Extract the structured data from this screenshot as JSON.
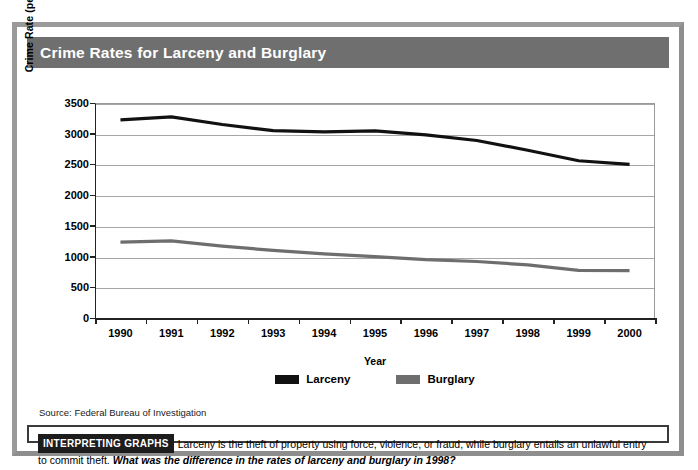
{
  "figure": {
    "title": "Crime Rates for Larceny and Burglary",
    "source": "Source: Federal Bureau of Investigation"
  },
  "caption": {
    "badge": "INTERPRETING GRAPHS",
    "body": "Larceny is the theft of property using force, violence, or fraud, while burglary entails an unlawful entry to commit theft.",
    "question": "What was the difference in the rates of larceny and burglary in 1998?"
  },
  "colors": {
    "larceny": "#111111",
    "burglary": "#6e6e6e",
    "title_band": "#6f6f6f",
    "frame": "#9a9a9a",
    "gridline": "#a6a6a6",
    "axis": "#222222"
  },
  "chart_data": {
    "type": "line",
    "title": "Crime Rates for Larceny and Burglary",
    "xlabel": "Year",
    "ylabel": "Crime Rate (per 100,000 population)",
    "categories": [
      "1990",
      "1991",
      "1992",
      "1993",
      "1994",
      "1995",
      "1996",
      "1997",
      "1998",
      "1999",
      "2000"
    ],
    "x": [
      1990,
      1991,
      1992,
      1993,
      1994,
      1995,
      1996,
      1997,
      1998,
      1999,
      2000
    ],
    "ylim": [
      0,
      3500
    ],
    "yticks": [
      0,
      500,
      1000,
      1500,
      2000,
      2500,
      3000,
      3500
    ],
    "ytick_labels": [
      "0",
      "500",
      "1000",
      "1500",
      "2000",
      "2500",
      "3000",
      "3500"
    ],
    "grid": true,
    "legend_position": "bottom-center",
    "series": [
      {
        "name": "Larceny",
        "color": "#111111",
        "values": [
          3225,
          3275,
          3150,
          3050,
          3030,
          3045,
          2980,
          2890,
          2730,
          2560,
          2500
        ]
      },
      {
        "name": "Burglary",
        "color": "#6e6e6e",
        "values": [
          1235,
          1255,
          1170,
          1100,
          1045,
          1000,
          950,
          920,
          865,
          775,
          770
        ]
      }
    ]
  }
}
